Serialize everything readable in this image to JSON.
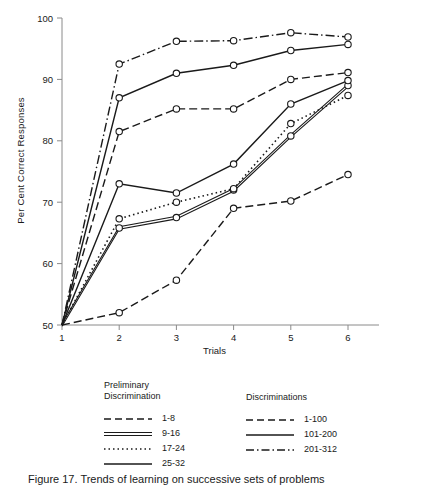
{
  "chart_data": {
    "type": "line",
    "title": "",
    "xlabel": "Trials",
    "ylabel": "Per Cent Correct Responses",
    "x": [
      1,
      2,
      3,
      4,
      5,
      6
    ],
    "xlim": [
      1,
      6
    ],
    "ylim": [
      50,
      100
    ],
    "xticks": [
      "1",
      "2",
      "3",
      "4",
      "5",
      "6"
    ],
    "yticks": [
      "50",
      "60",
      "70",
      "80",
      "90",
      "100"
    ],
    "grid": false,
    "legend_position": "below-plot",
    "series": [
      {
        "name": "1-8",
        "group": "Preliminary Discrimination",
        "style": "dashed",
        "values": [
          50,
          52.0,
          57.3,
          69.0,
          70.2,
          74.5
        ]
      },
      {
        "name": "9-16",
        "group": "Preliminary Discrimination",
        "style": "double",
        "values": [
          50,
          65.8,
          67.5,
          72.0,
          80.8,
          89.0
        ]
      },
      {
        "name": "17-24",
        "group": "Preliminary Discrimination",
        "style": "dotted",
        "values": [
          50,
          67.3,
          70.0,
          72.2,
          82.8,
          87.4
        ]
      },
      {
        "name": "25-32",
        "group": "Preliminary Discrimination",
        "style": "solid",
        "values": [
          50,
          73.0,
          71.5,
          76.2,
          86.0,
          89.8
        ]
      },
      {
        "name": "1-100",
        "group": "Discriminations",
        "style": "dashed",
        "values": [
          50,
          81.5,
          85.2,
          85.2,
          90.0,
          91.1
        ]
      },
      {
        "name": "101-200",
        "group": "Discriminations",
        "style": "solid",
        "values": [
          50,
          87.0,
          91.0,
          92.3,
          94.7,
          95.7
        ]
      },
      {
        "name": "201-312",
        "group": "Discriminations",
        "style": "dashdot",
        "values": [
          50,
          92.5,
          96.2,
          96.3,
          97.6,
          96.9
        ]
      }
    ],
    "marker": "open-circle",
    "line_color": "#1a1a1a",
    "axis_color": "#8a8a8a"
  },
  "axis": {
    "ylabel": "Per Cent Correct Responses",
    "xlabel": "Trials"
  },
  "legend": {
    "left": {
      "title": "Preliminary\nDiscrimination",
      "entries": [
        {
          "label": "1-8",
          "style": "dashed"
        },
        {
          "label": "9-16",
          "style": "double"
        },
        {
          "label": "17-24",
          "style": "dotted"
        },
        {
          "label": "25-32",
          "style": "solid"
        }
      ]
    },
    "right": {
      "title": "Discriminations",
      "entries": [
        {
          "label": "1-100",
          "style": "dashed"
        },
        {
          "label": "101-200",
          "style": "solid"
        },
        {
          "label": "201-312",
          "style": "dashdot"
        }
      ]
    }
  },
  "caption": "Figure 17.  Trends of learning on successive sets of problems"
}
